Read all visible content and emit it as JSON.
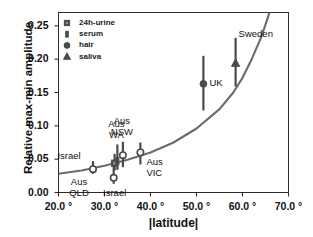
{
  "chart_data": {
    "type": "scatter",
    "title": "",
    "xlabel": "|latitude|",
    "ylabel": "Relative max-min amplitude",
    "xlim": [
      20.0,
      70.0
    ],
    "ylim": [
      0.0,
      0.27
    ],
    "xticks": [
      "20.0 °",
      "30.0 °",
      "40.0 °",
      "50.0 °",
      "60.0 °",
      "70.0 °"
    ],
    "xtick_values": [
      20.0,
      30.0,
      40.0,
      50.0,
      60.0,
      70.0
    ],
    "yticks": [
      "0.00",
      "0.05",
      "0.10",
      "0.15",
      "0.20",
      "0.25"
    ],
    "ytick_values": [
      0.0,
      0.05,
      0.1,
      0.15,
      0.2,
      0.25
    ],
    "grid": false,
    "legend_position": "top-left",
    "legend": [
      {
        "label": "24h-urine",
        "marker": "square"
      },
      {
        "label": "serum",
        "marker": "bar"
      },
      {
        "label": "hair",
        "marker": "circle"
      },
      {
        "label": "saliva",
        "marker": "triangle"
      }
    ],
    "points": [
      {
        "label": "Aus QLD",
        "marker": "circle-open",
        "x": 27.5,
        "y": 0.035,
        "ylow": 0.028,
        "yhigh": 0.047,
        "label_lines": [
          "Aus",
          "QLD"
        ],
        "label_pos": "below-left"
      },
      {
        "label": "Israel",
        "marker": "circle-open",
        "x": 32.0,
        "y": 0.022,
        "ylow": 0.013,
        "yhigh": 0.048,
        "label_lines": [
          "Israel"
        ],
        "label_pos": "below"
      },
      {
        "label": "Israel",
        "marker": "square",
        "x": 32.2,
        "y": 0.044,
        "ylow": 0.033,
        "yhigh": 0.058,
        "label_lines": [
          "Israel"
        ],
        "label_pos": "left"
      },
      {
        "label": "Aus WA",
        "marker": "bar",
        "x": 32.8,
        "y": 0.047,
        "ylow": 0.034,
        "yhigh": 0.072,
        "label_lines": [
          "Aus",
          "WA"
        ],
        "label_pos": "above"
      },
      {
        "label": "Aus NSW",
        "marker": "circle-open",
        "x": 34.0,
        "y": 0.056,
        "ylow": 0.038,
        "yhigh": 0.076,
        "label_lines": [
          "Aus",
          "NSW"
        ],
        "label_pos": "above"
      },
      {
        "label": "Aus VIC",
        "marker": "circle-open",
        "x": 37.8,
        "y": 0.06,
        "ylow": 0.042,
        "yhigh": 0.075,
        "label_lines": [
          "Aus",
          "VIC"
        ],
        "label_pos": "below-right"
      },
      {
        "label": "UK",
        "marker": "circle",
        "x": 51.5,
        "y": 0.163,
        "ylow": 0.123,
        "yhigh": 0.205,
        "label_lines": [
          "UK"
        ],
        "label_pos": "right"
      },
      {
        "label": "Sweden",
        "marker": "triangle",
        "x": 58.5,
        "y": 0.194,
        "ylow": 0.159,
        "yhigh": 0.232,
        "label_lines": [
          "Sweden"
        ],
        "label_pos": "above-right"
      }
    ],
    "fit_curve": {
      "description": "monotonic increasing exponential-like trend line",
      "points": [
        [
          20.0,
          0.028
        ],
        [
          25.0,
          0.033
        ],
        [
          30.0,
          0.04
        ],
        [
          35.0,
          0.049
        ],
        [
          40.0,
          0.06
        ],
        [
          45.0,
          0.075
        ],
        [
          50.0,
          0.096
        ],
        [
          55.0,
          0.125
        ],
        [
          58.0,
          0.15
        ],
        [
          60.0,
          0.172
        ],
        [
          62.0,
          0.2
        ],
        [
          64.0,
          0.232
        ],
        [
          65.5,
          0.262
        ],
        [
          66.5,
          0.285
        ]
      ]
    },
    "colors": {
      "marker": "#4a4a4a",
      "curve": "#6b6b6b",
      "axis": "#2b2b2b",
      "text": "#111111"
    }
  }
}
